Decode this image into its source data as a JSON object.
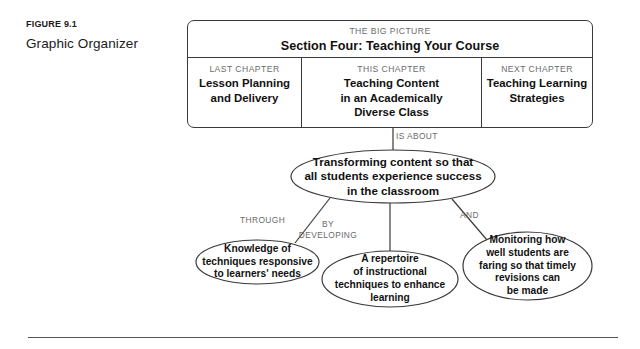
{
  "figure": {
    "number": "FIGURE 9.1",
    "title": "Graphic Organizer"
  },
  "big_picture": {
    "kicker": "THE BIG PICTURE",
    "title": "Section Four: Teaching Your Course",
    "columns": [
      {
        "kicker": "LAST CHAPTER",
        "name": "Lesson Planning\nand Delivery"
      },
      {
        "kicker": "THIS CHAPTER",
        "name": "Teaching Content\nin an Academically\nDiverse Class"
      },
      {
        "kicker": "NEXT CHAPTER",
        "name": "Teaching Learning\nStrategies"
      }
    ]
  },
  "connectors": {
    "is_about": "IS ABOUT",
    "through": "THROUGH",
    "by_developing": "BY\nDEVELOPING",
    "and": "AND"
  },
  "nodes": {
    "main": "Transforming content so that\nall students experience success\nin the classroom",
    "knowledge": "Knowledge of\ntechniques responsive\nto learners' needs",
    "repertoire": "A repertoire\nof instructional\ntechniques to enhance\nlearning",
    "monitoring": "Monitoring how\nwell students are\nfaring so that timely\nrevisions can\nbe made"
  },
  "colors": {
    "stroke": "#3a3a3a",
    "kicker_text": "#6b6b6b",
    "body_text": "#111111",
    "rule": "#555555"
  }
}
